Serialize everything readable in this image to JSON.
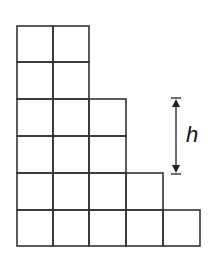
{
  "diagram": {
    "type": "staircase-grid",
    "columns": [
      {
        "index": 1,
        "squares": 6
      },
      {
        "index": 2,
        "squares": 6
      },
      {
        "index": 3,
        "squares": 4
      },
      {
        "index": 4,
        "squares": 2
      },
      {
        "index": 5,
        "squares": 1
      }
    ],
    "total_squares": 19,
    "dimension_marker": {
      "label": "h",
      "spans_squares": 2,
      "from_level": 4,
      "to_level": 2
    },
    "colors": {
      "line": "#333333",
      "background": "#ffffff",
      "text": "#111111"
    }
  }
}
